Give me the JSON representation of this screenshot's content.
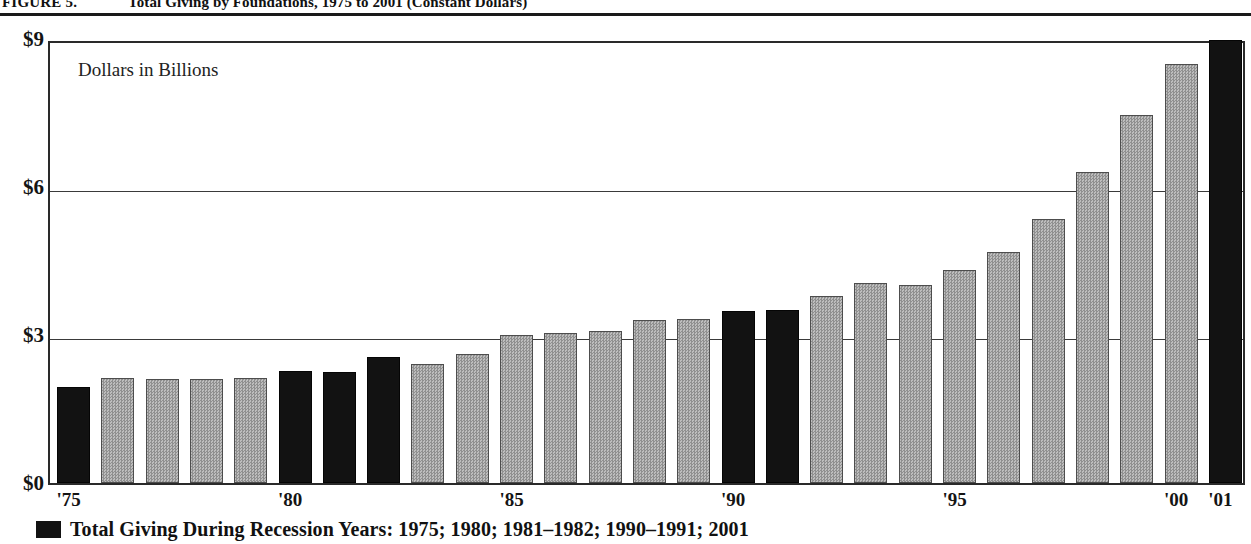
{
  "figure": {
    "label": "FIGURE 5.",
    "title": "Total Giving by Foundations, 1975 to 2001 (Constant Dollars)"
  },
  "annotation": "Dollars in Billions",
  "legend": {
    "swatch_color": "#121212",
    "text": "Total Giving During Recession Years: 1975; 1980; 1981–1982; 1990–1991; 2001"
  },
  "axis": {
    "y_ticks": [
      "$9",
      "$6",
      "$3",
      "$0"
    ],
    "y_values": [
      9,
      6,
      3,
      0
    ],
    "x_ticks": [
      "'75",
      "'80",
      "'85",
      "'90",
      "'95",
      "'00",
      "'01"
    ],
    "x_tick_years": [
      1975,
      1980,
      1985,
      1990,
      1995,
      2000,
      2001
    ]
  },
  "colors": {
    "recession_bar": "#121212",
    "normal_bar": "#b0b0b0",
    "axis": "#2a2a2a",
    "grid": "#3a3a3a",
    "background": "#ffffff"
  },
  "chart_data": {
    "type": "bar",
    "title": "Total Giving by Foundations, 1975 to 2001 (Constant Dollars)",
    "xlabel": "",
    "ylabel": "Dollars in Billions",
    "ylim": [
      0,
      9
    ],
    "yticks": [
      0,
      3,
      6,
      9
    ],
    "grid": true,
    "legend_position": "below-axis",
    "categories": [
      "1975",
      "1976",
      "1977",
      "1978",
      "1979",
      "1980",
      "1981",
      "1982",
      "1983",
      "1984",
      "1985",
      "1986",
      "1987",
      "1988",
      "1989",
      "1990",
      "1991",
      "1992",
      "1993",
      "1994",
      "1995",
      "1996",
      "1997",
      "1998",
      "1999",
      "2000",
      "2001"
    ],
    "values": [
      1.95,
      2.12,
      2.1,
      2.1,
      2.12,
      2.28,
      2.26,
      2.55,
      2.42,
      2.62,
      3.0,
      3.05,
      3.08,
      3.3,
      3.32,
      3.48,
      3.5,
      3.8,
      4.05,
      4.02,
      4.32,
      4.68,
      5.35,
      6.3,
      7.45,
      8.5,
      8.98
    ],
    "series": [
      {
        "name": "Total Giving During Recession Years",
        "color": "#121212",
        "recession_years": [
          1975,
          1980,
          1981,
          1982,
          1990,
          1991,
          2001
        ]
      },
      {
        "name": "Total Giving",
        "color": "#b0b0b0"
      }
    ],
    "bars": [
      {
        "year": 1975,
        "label": "'75",
        "value": 1.95,
        "recession": true
      },
      {
        "year": 1976,
        "label": "",
        "value": 2.12,
        "recession": false
      },
      {
        "year": 1977,
        "label": "",
        "value": 2.1,
        "recession": false
      },
      {
        "year": 1978,
        "label": "",
        "value": 2.1,
        "recession": false
      },
      {
        "year": 1979,
        "label": "",
        "value": 2.12,
        "recession": false
      },
      {
        "year": 1980,
        "label": "'80",
        "value": 2.28,
        "recession": true
      },
      {
        "year": 1981,
        "label": "",
        "value": 2.26,
        "recession": true
      },
      {
        "year": 1982,
        "label": "",
        "value": 2.55,
        "recession": true
      },
      {
        "year": 1983,
        "label": "",
        "value": 2.42,
        "recession": false
      },
      {
        "year": 1984,
        "label": "",
        "value": 2.62,
        "recession": false
      },
      {
        "year": 1985,
        "label": "'85",
        "value": 3.0,
        "recession": false
      },
      {
        "year": 1986,
        "label": "",
        "value": 3.05,
        "recession": false
      },
      {
        "year": 1987,
        "label": "",
        "value": 3.08,
        "recession": false
      },
      {
        "year": 1988,
        "label": "",
        "value": 3.3,
        "recession": false
      },
      {
        "year": 1989,
        "label": "",
        "value": 3.32,
        "recession": false
      },
      {
        "year": 1990,
        "label": "'90",
        "value": 3.48,
        "recession": true
      },
      {
        "year": 1991,
        "label": "",
        "value": 3.5,
        "recession": true
      },
      {
        "year": 1992,
        "label": "",
        "value": 3.8,
        "recession": false
      },
      {
        "year": 1993,
        "label": "",
        "value": 4.05,
        "recession": false
      },
      {
        "year": 1994,
        "label": "",
        "value": 4.02,
        "recession": false
      },
      {
        "year": 1995,
        "label": "'95",
        "value": 4.32,
        "recession": false
      },
      {
        "year": 1996,
        "label": "",
        "value": 4.68,
        "recession": false
      },
      {
        "year": 1997,
        "label": "",
        "value": 5.35,
        "recession": false
      },
      {
        "year": 1998,
        "label": "",
        "value": 6.3,
        "recession": false
      },
      {
        "year": 1999,
        "label": "",
        "value": 7.45,
        "recession": false
      },
      {
        "year": 2000,
        "label": "'00",
        "value": 8.5,
        "recession": false
      },
      {
        "year": 2001,
        "label": "'01",
        "value": 8.98,
        "recession": true
      }
    ]
  }
}
